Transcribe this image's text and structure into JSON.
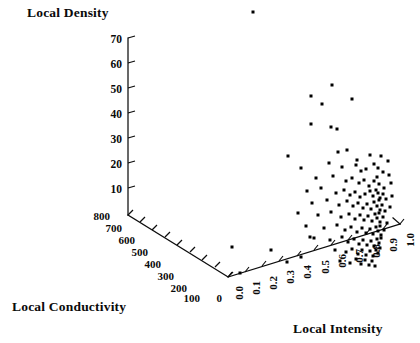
{
  "chart_data": {
    "type": "scatter",
    "projection": "3d",
    "title": "",
    "zlabel": "Local Density",
    "xlabel": "Local Intensity",
    "ylabel": "Local Conductivity",
    "grid": false,
    "legend": null,
    "axes": {
      "density": {
        "label": "Local Density",
        "ticks": [
          10,
          20,
          30,
          40,
          50,
          60,
          70
        ],
        "tick_labels": [
          "10",
          "20",
          "30",
          "40",
          "50",
          "60",
          "70"
        ],
        "range": [
          0,
          75
        ]
      },
      "conductivity": {
        "label": "Local Conductivity",
        "ticks": [
          0,
          100,
          200,
          300,
          400,
          500,
          600,
          700,
          800
        ],
        "tick_labels": [
          "0",
          "100",
          "200",
          "300",
          "400",
          "500",
          "600",
          "700",
          "800"
        ],
        "range": [
          0,
          800
        ]
      },
      "intensity": {
        "label": "Local Intensity",
        "ticks": [
          0.0,
          0.1,
          0.2,
          0.3,
          0.4,
          0.5,
          0.6,
          0.7,
          0.8,
          0.9,
          1.0
        ],
        "tick_labels": [
          "0.0",
          "0.1",
          "0.2",
          "0.3",
          "0.4",
          "0.5",
          "0.6",
          "0.7",
          "0.8",
          "0.9",
          "1.0"
        ],
        "range": [
          0.0,
          1.0
        ]
      }
    },
    "marker": {
      "shape": "square",
      "color": "#000000",
      "size_px": 3
    },
    "point_count": 131,
    "points_px": [
      [
        253,
        12
      ],
      [
        332,
        85
      ],
      [
        311,
        96
      ],
      [
        352,
        99
      ],
      [
        322,
        104
      ],
      [
        311,
        124
      ],
      [
        331,
        127
      ],
      [
        337,
        129
      ],
      [
        288,
        156
      ],
      [
        338,
        152
      ],
      [
        347,
        150
      ],
      [
        357,
        160
      ],
      [
        370,
        155
      ],
      [
        381,
        156
      ],
      [
        388,
        161
      ],
      [
        301,
        168
      ],
      [
        329,
        163
      ],
      [
        342,
        167
      ],
      [
        356,
        165
      ],
      [
        361,
        171
      ],
      [
        366,
        169
      ],
      [
        374,
        164
      ],
      [
        378,
        168
      ],
      [
        383,
        172
      ],
      [
        389,
        175
      ],
      [
        316,
        178
      ],
      [
        333,
        176
      ],
      [
        346,
        181
      ],
      [
        352,
        178
      ],
      [
        359,
        183
      ],
      [
        364,
        180
      ],
      [
        369,
        186
      ],
      [
        374,
        181
      ],
      [
        377,
        177
      ],
      [
        379,
        184
      ],
      [
        384,
        188
      ],
      [
        391,
        183
      ],
      [
        307,
        191
      ],
      [
        321,
        188
      ],
      [
        336,
        193
      ],
      [
        344,
        190
      ],
      [
        350,
        195
      ],
      [
        355,
        192
      ],
      [
        360,
        197
      ],
      [
        365,
        194
      ],
      [
        370,
        191
      ],
      [
        373,
        196
      ],
      [
        376,
        190
      ],
      [
        378,
        193
      ],
      [
        380,
        198
      ],
      [
        383,
        194
      ],
      [
        386,
        199
      ],
      [
        392,
        196
      ],
      [
        312,
        203
      ],
      [
        327,
        200
      ],
      [
        339,
        205
      ],
      [
        347,
        201
      ],
      [
        353,
        206
      ],
      [
        358,
        203
      ],
      [
        363,
        208
      ],
      [
        367,
        204
      ],
      [
        371,
        209
      ],
      [
        374,
        202
      ],
      [
        377,
        206
      ],
      [
        379,
        200
      ],
      [
        380,
        210
      ],
      [
        382,
        205
      ],
      [
        385,
        211
      ],
      [
        390,
        207
      ],
      [
        298,
        213
      ],
      [
        318,
        215
      ],
      [
        331,
        212
      ],
      [
        341,
        217
      ],
      [
        349,
        214
      ],
      [
        355,
        219
      ],
      [
        360,
        215
      ],
      [
        364,
        220
      ],
      [
        368,
        216
      ],
      [
        372,
        221
      ],
      [
        375,
        214
      ],
      [
        377,
        218
      ],
      [
        379,
        213
      ],
      [
        380,
        222
      ],
      [
        383,
        217
      ],
      [
        387,
        223
      ],
      [
        306,
        226
      ],
      [
        324,
        228
      ],
      [
        337,
        225
      ],
      [
        345,
        230
      ],
      [
        351,
        227
      ],
      [
        357,
        232
      ],
      [
        362,
        228
      ],
      [
        366,
        233
      ],
      [
        370,
        229
      ],
      [
        373,
        234
      ],
      [
        376,
        227
      ],
      [
        378,
        231
      ],
      [
        380,
        226
      ],
      [
        381,
        235
      ],
      [
        384,
        230
      ],
      [
        314,
        238
      ],
      [
        330,
        240
      ],
      [
        342,
        237
      ],
      [
        348,
        242
      ],
      [
        354,
        239
      ],
      [
        359,
        244
      ],
      [
        363,
        240
      ],
      [
        367,
        245
      ],
      [
        371,
        241
      ],
      [
        374,
        246
      ],
      [
        377,
        239
      ],
      [
        379,
        243
      ],
      [
        381,
        238
      ],
      [
        335,
        250
      ],
      [
        346,
        252
      ],
      [
        352,
        249
      ],
      [
        358,
        254
      ],
      [
        362,
        250
      ],
      [
        366,
        255
      ],
      [
        370,
        251
      ],
      [
        373,
        256
      ],
      [
        376,
        250
      ],
      [
        378,
        253
      ],
      [
        380,
        248
      ],
      [
        301,
        257
      ],
      [
        340,
        261
      ],
      [
        350,
        263
      ],
      [
        356,
        259
      ],
      [
        361,
        264
      ],
      [
        365,
        260
      ],
      [
        369,
        265
      ],
      [
        372,
        261
      ],
      [
        375,
        266
      ],
      [
        232,
        247
      ],
      [
        240,
        273
      ],
      [
        271,
        250
      ],
      [
        287,
        262
      ],
      [
        310,
        237
      ]
    ]
  }
}
